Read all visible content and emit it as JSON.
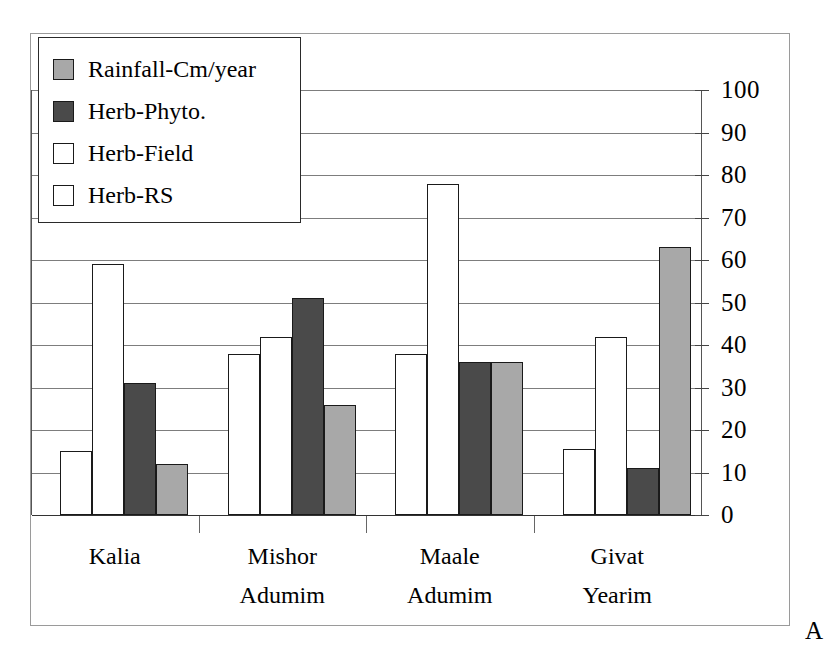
{
  "figure": {
    "panel_letter": "A"
  },
  "legend": {
    "position": "top-left-inside-plot",
    "items": [
      {
        "label": "Rainfall-Cm/year",
        "color": "#a8a8a8",
        "swatch_icon": "legend-swatch-filled"
      },
      {
        "label": "Herb-Phyto.",
        "color": "#4a4a4a",
        "swatch_icon": "legend-swatch-filled"
      },
      {
        "label": "Herb-Field",
        "color": "#ffffff",
        "swatch_icon": "legend-swatch-outline"
      },
      {
        "label": "Herb-RS",
        "color": "#ffffff",
        "swatch_icon": "legend-swatch-outline"
      }
    ]
  },
  "chart_data": {
    "type": "bar",
    "title": "",
    "xlabel": "",
    "ylabel": "",
    "ylim": [
      0,
      100
    ],
    "ytick_step": 10,
    "yticks": [
      0,
      10,
      20,
      30,
      40,
      50,
      60,
      70,
      80,
      90,
      100
    ],
    "ytick_labels": [
      "0",
      "10",
      "20",
      "30",
      "40",
      "50",
      "60",
      "70",
      "80",
      "90",
      "100"
    ],
    "yaxis_side": "right",
    "grid": true,
    "legend_position": "upper left",
    "categories": [
      "Kalia",
      "Mishor Adumim",
      "Maale Adumim",
      "Givat Yearim"
    ],
    "category_label_lines": [
      [
        "Kalia",
        ""
      ],
      [
        "Mishor",
        "Adumim"
      ],
      [
        "Maale",
        "Adumim"
      ],
      [
        "Givat",
        "Yearim"
      ]
    ],
    "series": [
      {
        "name": "Herb-RS",
        "color": "#ffffff",
        "values": [
          15,
          38,
          38,
          15.5
        ]
      },
      {
        "name": "Herb-Field",
        "color": "#ffffff",
        "values": [
          59,
          42,
          78,
          42
        ]
      },
      {
        "name": "Herb-Phyto.",
        "color": "#4a4a4a",
        "values": [
          31,
          51,
          36,
          11
        ]
      },
      {
        "name": "Rainfall-Cm/year",
        "color": "#a8a8a8",
        "values": [
          12,
          26,
          36,
          63
        ]
      }
    ]
  }
}
